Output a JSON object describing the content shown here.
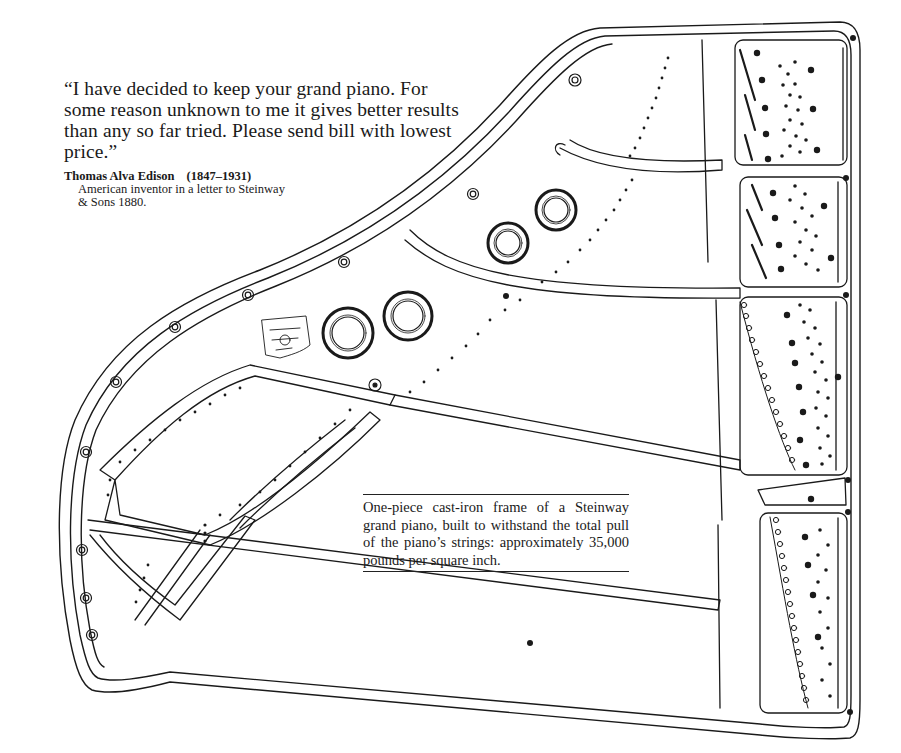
{
  "quote": {
    "text": "“I have decided to keep your grand piano. For some reason unknown to me it gives better results than any so far tried. Please send bill with lowest price.”",
    "author": "Thomas Alva Edison",
    "years": "(1847–1931)",
    "description": "American inventor in a letter to Steinway & Sons 1880."
  },
  "caption": {
    "text": "One-piece cast-iron frame of a Steinway grand piano, built to withstand the total pull of the piano’s strings: approximately 35,000 pounds per square inch."
  },
  "illustration": {
    "subject": "piano-cast-iron-frame",
    "line_color": "#1a1a1a",
    "background": "#ffffff"
  }
}
